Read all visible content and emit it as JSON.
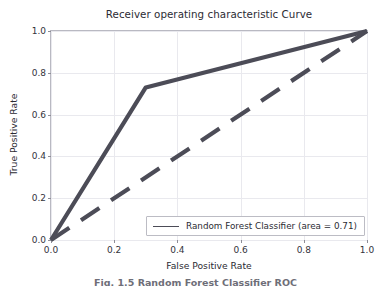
{
  "chart_data": {
    "type": "line",
    "title": "Receiver operating characteristic Curve",
    "xlabel": "False Positive Rate",
    "ylabel": "True Positive Rate",
    "xlim": [
      0.0,
      1.0
    ],
    "ylim": [
      0.0,
      1.0
    ],
    "xticks": [
      "0.0",
      "0.2",
      "0.4",
      "0.6",
      "0.8",
      "1.0"
    ],
    "yticks": [
      "0.0",
      "0.2",
      "0.4",
      "0.6",
      "0.8",
      "1.0"
    ],
    "xtick_values": [
      0.0,
      0.2,
      0.4,
      0.6,
      0.8,
      1.0
    ],
    "ytick_values": [
      0.0,
      0.2,
      0.4,
      0.6,
      0.8,
      1.0
    ],
    "grid": true,
    "legend_position": "lower right",
    "series": [
      {
        "name": "Random Forest Classifier (area = 0.71)",
        "style": "solid",
        "color": "#4c4c57",
        "x": [
          0.0,
          0.3,
          1.0
        ],
        "y": [
          0.0,
          0.73,
          1.0
        ]
      },
      {
        "name": "chance-diagonal",
        "style": "dashed",
        "color": "#4c4c57",
        "x": [
          0.0,
          1.0
        ],
        "y": [
          0.0,
          1.0
        ]
      }
    ],
    "auc": 0.71
  },
  "legend": {
    "entries": [
      {
        "label": "Random Forest Classifier (area = 0.71)"
      }
    ]
  },
  "caption": {
    "text": "Fig. 1.5  Random Forest Classifier ROC"
  }
}
